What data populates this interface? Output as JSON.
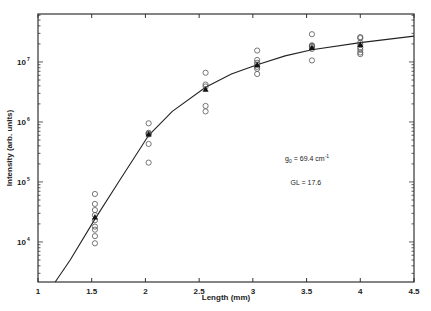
{
  "chart_data": {
    "type": "scatter",
    "title": "",
    "xlabel": "Length (mm)",
    "ylabel": "Intensity (arb. units)",
    "xlim": [
      1,
      4.5
    ],
    "ylim": [
      2150,
      63000000
    ],
    "yscale": "log",
    "grid": false,
    "legend": null,
    "x_ticks": [
      1,
      1.5,
      2,
      2.5,
      3,
      3.5,
      4,
      4.5
    ],
    "x_tick_labels": [
      "1",
      "1.5",
      "2",
      "2.5",
      "3",
      "3.5",
      "4",
      "4.5"
    ],
    "y_ticks": [
      10000,
      100000,
      1000000,
      10000000
    ],
    "y_tick_labels": [
      {
        "base": "10",
        "exp": "4"
      },
      {
        "base": "10",
        "exp": "5"
      },
      {
        "base": "10",
        "exp": "6"
      },
      {
        "base": "10",
        "exp": "7"
      }
    ],
    "annotations": [
      {
        "text_main": "g",
        "text_sub": "0",
        "text_rest": " = 69.4 cm",
        "text_sup": "-1",
        "x": 3.3,
        "y": 220000
      },
      {
        "text": "GL = 17.6",
        "x": 3.35,
        "y": 90000
      }
    ],
    "series": [
      {
        "name": "measurements",
        "marker": "open-circle",
        "points": [
          [
            1.53,
            63000
          ],
          [
            1.53,
            43000
          ],
          [
            1.53,
            34000
          ],
          [
            1.53,
            28000
          ],
          [
            1.53,
            23000
          ],
          [
            1.53,
            18000
          ],
          [
            1.53,
            16000
          ],
          [
            1.53,
            12500
          ],
          [
            1.53,
            9500
          ],
          [
            2.03,
            950000
          ],
          [
            2.03,
            660000
          ],
          [
            2.03,
            640000
          ],
          [
            2.03,
            620000
          ],
          [
            2.03,
            430000
          ],
          [
            2.03,
            210000
          ],
          [
            2.56,
            6600000
          ],
          [
            2.56,
            4200000
          ],
          [
            2.56,
            3900000
          ],
          [
            2.56,
            1850000
          ],
          [
            2.56,
            1500000
          ],
          [
            3.04,
            15500000
          ],
          [
            3.04,
            10800000
          ],
          [
            3.04,
            9700000
          ],
          [
            3.04,
            9000000
          ],
          [
            3.04,
            8300000
          ],
          [
            3.04,
            7700000
          ],
          [
            3.04,
            6300000
          ],
          [
            3.55,
            29000000
          ],
          [
            3.55,
            19000000
          ],
          [
            3.55,
            18500000
          ],
          [
            3.55,
            17800000
          ],
          [
            3.55,
            16500000
          ],
          [
            3.55,
            10600000
          ],
          [
            4.0,
            26000000
          ],
          [
            4.0,
            25000000
          ],
          [
            4.0,
            21000000
          ],
          [
            4.0,
            19500000
          ],
          [
            4.0,
            17400000
          ],
          [
            4.0,
            16000000
          ],
          [
            4.0,
            14400000
          ],
          [
            4.0,
            13500000
          ]
        ]
      },
      {
        "name": "mean",
        "marker": "filled",
        "points": [
          [
            1.53,
            26000
          ],
          [
            2.03,
            630000
          ],
          [
            2.56,
            3500000
          ],
          [
            3.04,
            9000000
          ],
          [
            3.55,
            17500000
          ],
          [
            4.0,
            19500000
          ]
        ]
      },
      {
        "name": "fit",
        "marker": "line",
        "points": [
          [
            1.16,
            2150
          ],
          [
            1.3,
            5000
          ],
          [
            1.53,
            24000
          ],
          [
            1.75,
            100000
          ],
          [
            2.03,
            600000
          ],
          [
            2.25,
            1500000
          ],
          [
            2.56,
            3800000
          ],
          [
            2.8,
            6300000
          ],
          [
            3.04,
            9000000
          ],
          [
            3.3,
            12600000
          ],
          [
            3.55,
            16000000
          ],
          [
            4.0,
            21000000
          ],
          [
            4.5,
            27000000
          ]
        ]
      }
    ]
  },
  "layout": {
    "plot": {
      "left": 38,
      "top": 14,
      "right": 414,
      "bottom": 282
    },
    "colors": {
      "axis": "#333333",
      "marker": "#555555",
      "line": "#222222",
      "filled": "#111111"
    }
  }
}
